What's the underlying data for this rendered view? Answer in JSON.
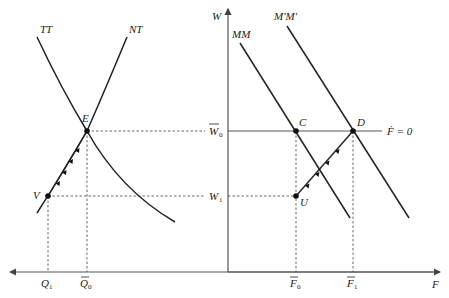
{
  "diagram": {
    "type": "economic-diagram",
    "left_panel": {
      "curves": [
        {
          "id": "TT",
          "label": "TT"
        },
        {
          "id": "NT",
          "label": "NT"
        }
      ],
      "points": [
        {
          "id": "E",
          "label": "E"
        },
        {
          "id": "V",
          "label": "V"
        }
      ],
      "x_ticks": [
        {
          "label": "Q",
          "sub": "1",
          "bar": false
        },
        {
          "label": "Q",
          "sub": "0",
          "bar": true
        }
      ]
    },
    "right_panel": {
      "y_axis_label": "W",
      "x_axis_label": "F",
      "curves": [
        {
          "id": "MM",
          "label": "MM"
        },
        {
          "id": "MpMp",
          "label": "M′M′"
        }
      ],
      "points": [
        {
          "id": "C",
          "label": "C"
        },
        {
          "id": "D",
          "label": "D"
        },
        {
          "id": "U",
          "label": "U"
        }
      ],
      "y_ticks": [
        {
          "label": "W",
          "sub": "0",
          "bar": true
        },
        {
          "label": "W",
          "sub": "1",
          "bar": false
        }
      ],
      "x_ticks": [
        {
          "label": "F",
          "sub": "0",
          "bar": true
        },
        {
          "label": "F",
          "sub": "1",
          "bar": true
        }
      ],
      "horizontal_line_label": "Ḟ = 0"
    }
  }
}
